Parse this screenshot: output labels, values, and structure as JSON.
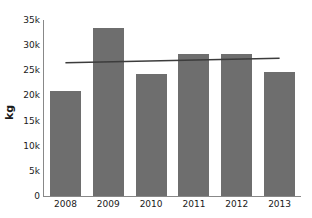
{
  "chart_data": {
    "type": "bar",
    "title": "",
    "subtitle": "",
    "xlabel": "",
    "ylabel": "kg",
    "categories": [
      "2008",
      "2009",
      "2010",
      "2011",
      "2012",
      "2013"
    ],
    "values": [
      20900,
      33400,
      24200,
      28300,
      28200,
      24600
    ],
    "series": [
      {
        "name": "kg",
        "values": [
          20900,
          33400,
          24200,
          28300,
          28200,
          24600
        ]
      }
    ],
    "ylim": [
      0,
      35000
    ],
    "xlim": [
      0,
      6
    ],
    "ytick_values": [
      0,
      5000,
      10000,
      15000,
      20000,
      25000,
      30000,
      35000
    ],
    "ytick_labels": [
      "0",
      "5k",
      "10k",
      "15k",
      "20k",
      "25k",
      "30k",
      "35k"
    ],
    "xtick_labels": [
      "2008",
      "2009",
      "2010",
      "2011",
      "2012",
      "2013"
    ],
    "grid": false,
    "legend": "none",
    "annotations": [
      {
        "name": "trend-line",
        "type": "line",
        "x_start": 2008,
        "x_end": 2013,
        "y_start": 26500,
        "y_end": 27400
      }
    ],
    "colors": {
      "bar": "#6e6e6e",
      "trend_line": "#3c3c3c",
      "axis": "#888888",
      "text": "#1a1a1a",
      "background": "#ffffff"
    }
  }
}
